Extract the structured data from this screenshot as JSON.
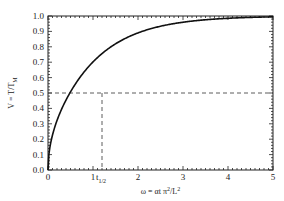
{
  "chart_data": {
    "type": "line",
    "title": "",
    "xlabel": "ω = αt π²/L²",
    "ylabel": "V = T/T_M",
    "xlim": [
      0,
      5
    ],
    "ylim": [
      0,
      1
    ],
    "x_ticks": [
      "0",
      "1",
      "2",
      "3",
      "4",
      "5"
    ],
    "y_ticks": [
      "0.0",
      "0.1",
      "0.2",
      "0.3",
      "0.4",
      "0.5",
      "0.6",
      "0.7",
      "0.8",
      "0.9",
      "1.0"
    ],
    "grid": false,
    "legend": null,
    "series": [
      {
        "name": "V(ω)",
        "x": [
          0,
          0.1,
          0.2,
          0.3,
          0.4,
          0.5,
          0.6,
          0.7,
          0.8,
          0.9,
          1.0,
          1.2,
          1.4,
          1.6,
          1.8,
          2.0,
          2.5,
          3.0,
          3.5,
          4.0,
          4.5,
          5.0
        ],
        "values": [
          0.0,
          0.0,
          0.004,
          0.023,
          0.062,
          0.117,
          0.18,
          0.243,
          0.3,
          0.354,
          0.404,
          0.5,
          0.58,
          0.653,
          0.716,
          0.76,
          0.85,
          0.92,
          0.95,
          0.97,
          0.985,
          0.993
        ]
      }
    ],
    "annotations": [
      {
        "type": "hline",
        "y": 0.5,
        "style": "dashed"
      },
      {
        "type": "vline",
        "x": 1.2,
        "style": "dashed",
        "label": "t",
        "label_sub": "1/2"
      }
    ]
  },
  "labels": {
    "xlabel_main": "ω = αt π",
    "xlabel_sup1": "2",
    "xlabel_mid": "/L",
    "xlabel_sup2": "2",
    "ylabel_main": "V = T/T",
    "ylabel_sub": "M",
    "thalf_main": "t",
    "thalf_sub": "1/2"
  }
}
